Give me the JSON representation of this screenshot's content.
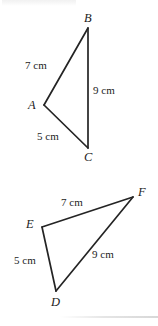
{
  "figure": {
    "background_color": "#ffffff",
    "stroke_color": "#242424",
    "text_color": "#1c1c1c",
    "width": 158,
    "height": 326
  },
  "triangles": [
    {
      "id": "triangle-abc",
      "name": "Triangle ABC",
      "vertices": [
        {
          "label": "B",
          "x": 88,
          "y": 28,
          "label_x": 84,
          "label_y": 12
        },
        {
          "label": "A",
          "x": 44,
          "y": 105,
          "label_x": 28,
          "label_y": 99
        },
        {
          "label": "C",
          "x": 88,
          "y": 148,
          "label_x": 84,
          "label_y": 151
        }
      ],
      "sides": [
        {
          "label": "7 cm",
          "from": "A",
          "to": "B",
          "label_x": 25,
          "label_y": 60
        },
        {
          "label": "9 cm",
          "from": "B",
          "to": "C",
          "label_x": 93,
          "label_y": 85
        },
        {
          "label": "5 cm",
          "from": "A",
          "to": "C",
          "label_x": 37,
          "label_y": 131
        }
      ]
    },
    {
      "id": "triangle-def",
      "name": "Triangle DEF",
      "vertices": [
        {
          "label": "F",
          "x": 133,
          "y": 197,
          "label_x": 138,
          "label_y": 186
        },
        {
          "label": "E",
          "x": 42,
          "y": 227,
          "label_x": 26,
          "label_y": 218
        },
        {
          "label": "D",
          "x": 56,
          "y": 291,
          "label_x": 51,
          "label_y": 296
        }
      ],
      "sides": [
        {
          "label": "7 cm",
          "from": "E",
          "to": "F",
          "label_x": 61,
          "label_y": 197
        },
        {
          "label": "9 cm",
          "from": "D",
          "to": "F",
          "label_x": 92,
          "label_y": 249
        },
        {
          "label": "5 cm",
          "from": "D",
          "to": "E",
          "label_x": 14,
          "label_y": 255
        }
      ]
    }
  ]
}
